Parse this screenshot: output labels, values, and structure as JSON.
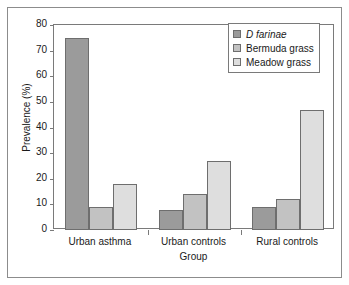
{
  "chart_data": {
    "type": "bar",
    "title": "",
    "xlabel": "Group",
    "ylabel": "Prevalence (%)",
    "categories": [
      "Urban asthma",
      "Urban controls",
      "Rural controls"
    ],
    "series": [
      {
        "name": "D farinae",
        "values": [
          75,
          8,
          9
        ],
        "color": "#9b9b9b",
        "italic": true
      },
      {
        "name": "Bermuda grass",
        "values": [
          9,
          14,
          12
        ],
        "color": "#c2c2c2",
        "italic": false
      },
      {
        "name": "Meadow grass",
        "values": [
          18,
          27,
          47
        ],
        "color": "#dedede",
        "italic": false
      }
    ],
    "group_values": {
      "Urban asthma": {
        "D farinae": 75,
        "Bermuda grass": 8,
        "Meadow grass": 9
      },
      "Urban controls": {
        "D farinae": 9,
        "Bermuda grass": 14,
        "Meadow grass": 12
      },
      "Rural controls": {
        "D farinae": 18,
        "Bermuda grass": 27,
        "Meadow grass": 47
      }
    },
    "ylim": [
      0,
      80
    ],
    "ytick_values": [
      80,
      70,
      60,
      50,
      40,
      30,
      20,
      10,
      0
    ],
    "ytick_labels": [
      "80",
      "70",
      "60",
      "50",
      "40",
      "30",
      "20",
      "10",
      "0"
    ],
    "grid": false,
    "legend_position": "top-right",
    "legend_entries": [
      "D farinae",
      "Bermuda grass",
      "Meadow grass"
    ]
  },
  "axes": {
    "y_title": "Prevalence (%)",
    "x_title": "Group"
  }
}
